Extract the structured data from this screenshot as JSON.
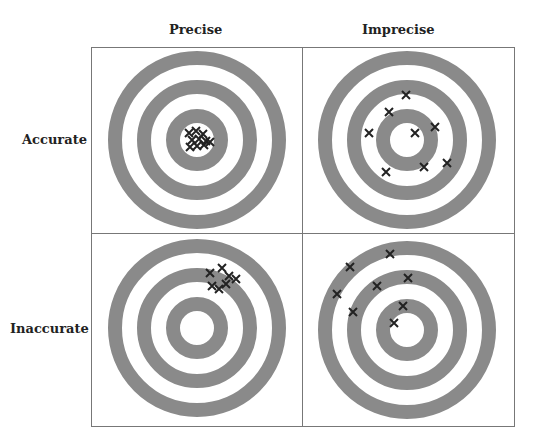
{
  "columns": [
    "Precise",
    "Imprecise"
  ],
  "rows": [
    "Accurate",
    "Inaccurate"
  ],
  "colors": {
    "ring": "#8a8a8a",
    "marker": "#222222",
    "border": "#777777"
  },
  "targets": [
    {
      "name": "accurate-precise",
      "cx": 197,
      "cy": 140,
      "hits": [
        [
          189,
          133
        ],
        [
          196,
          131
        ],
        [
          203,
          134
        ],
        [
          192,
          140
        ],
        [
          199,
          139
        ],
        [
          206,
          141
        ],
        [
          190,
          147
        ],
        [
          197,
          146
        ],
        [
          204,
          145
        ],
        [
          210,
          142
        ]
      ]
    },
    {
      "name": "accurate-imprecise",
      "cx": 407,
      "cy": 140,
      "hits": [
        [
          406,
          95
        ],
        [
          389,
          112
        ],
        [
          369,
          133
        ],
        [
          415,
          133
        ],
        [
          435,
          127
        ],
        [
          386,
          172
        ],
        [
          424,
          167
        ],
        [
          447,
          163
        ]
      ]
    },
    {
      "name": "inaccurate-precise",
      "cx": 197,
      "cy": 328,
      "hits": [
        [
          210,
          273
        ],
        [
          222,
          268
        ],
        [
          229,
          276
        ],
        [
          236,
          279
        ],
        [
          212,
          286
        ],
        [
          219,
          289
        ],
        [
          226,
          284
        ]
      ]
    },
    {
      "name": "inaccurate-imprecise",
      "cx": 407,
      "cy": 330,
      "hits": [
        [
          390,
          254
        ],
        [
          350,
          267
        ],
        [
          408,
          278
        ],
        [
          377,
          286
        ],
        [
          337,
          294
        ],
        [
          353,
          312
        ],
        [
          403,
          306
        ],
        [
          394,
          323
        ]
      ]
    }
  ]
}
